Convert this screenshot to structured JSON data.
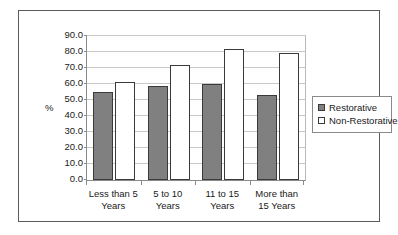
{
  "chart_data": {
    "type": "bar",
    "title": "",
    "subtitle": "",
    "xlabel": "",
    "ylabel": "%",
    "categories": [
      "Less than 5 Years",
      "5 to 10 Years",
      "11 to 15 Years",
      "More than 15 Years"
    ],
    "category_lines": [
      [
        "Less than 5",
        "Years"
      ],
      [
        "5 to 10",
        "Years"
      ],
      [
        "11 to 15",
        "Years"
      ],
      [
        "More than",
        "15 Years"
      ]
    ],
    "series": [
      {
        "name": "Restorative",
        "values": [
          55.0,
          59.0,
          60.0,
          53.0
        ],
        "color": "#808080"
      },
      {
        "name": "Non-Restorative",
        "values": [
          61.0,
          72.0,
          82.0,
          79.5
        ],
        "color": "#ffffff"
      }
    ],
    "ylim": [
      0,
      90
    ],
    "yticks": [
      0,
      10,
      20,
      30,
      40,
      50,
      60,
      70,
      80,
      90
    ],
    "ytick_labels": [
      "0.0",
      "10.0",
      "20.0",
      "30.0",
      "40.0",
      "50.0",
      "60.0",
      "70.0",
      "80.0",
      "90.0"
    ],
    "grid": true,
    "legend_position": "right"
  },
  "legend": {
    "entries": [
      {
        "label": "Restorative",
        "swatch": "filled-gray-square"
      },
      {
        "label": "Non-Restorative",
        "swatch": "outlined-white-square"
      }
    ]
  }
}
